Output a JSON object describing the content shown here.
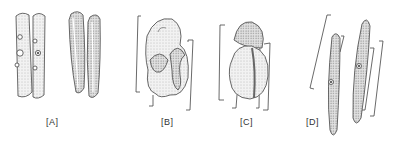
{
  "figure": {
    "panels": [
      {
        "id": "A",
        "label": "[A]"
      },
      {
        "id": "B",
        "label": "[B]"
      },
      {
        "id": "C",
        "label": "[C]"
      },
      {
        "id": "D",
        "label": "[D]"
      }
    ]
  }
}
